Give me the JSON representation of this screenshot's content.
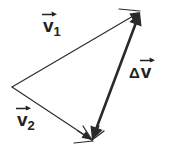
{
  "figure": {
    "type": "vector-diagram",
    "width": 169,
    "height": 152,
    "background_color": "#ffffff",
    "stroke_color": "#2a2a2a"
  },
  "labels": {
    "v1": {
      "base": "v",
      "subscript": "1",
      "has_overarrow": true,
      "text": "v⃗1"
    },
    "v2": {
      "base": "v",
      "subscript": "2",
      "has_overarrow": true,
      "text": "v⃗2"
    },
    "delta_v": {
      "delta": "Δ",
      "base": "v",
      "subscript": "",
      "has_overarrow": true,
      "text": "Δv⃗"
    }
  },
  "geometry": {
    "vertices": {
      "tail": {
        "x": 12,
        "y": 87
      },
      "head_top": {
        "x": 140,
        "y": 12
      },
      "head_bottom": {
        "x": 92,
        "y": 140
      }
    },
    "vectors": [
      {
        "name": "v1",
        "from": {
          "x": 12,
          "y": 87
        },
        "to": {
          "x": 140,
          "y": 12
        },
        "stroke_width": 1.1,
        "arrow_at_end": true,
        "arrow_at_start": false
      },
      {
        "name": "v2",
        "from": {
          "x": 12,
          "y": 87
        },
        "to": {
          "x": 92,
          "y": 140
        },
        "stroke_width": 1.1,
        "arrow_at_end": true,
        "arrow_at_start": false
      },
      {
        "name": "delta_v",
        "from": {
          "x": 92,
          "y": 140
        },
        "to": {
          "x": 140,
          "y": 12
        },
        "stroke_width": 2.6,
        "arrow_at_end": true,
        "arrow_at_start": true
      }
    ],
    "tick_marks": [
      {
        "name": "apex-tick",
        "x1": 119,
        "y1": 9,
        "x2": 140,
        "y2": 11
      },
      {
        "name": "base-tick",
        "x1": 74,
        "y1": 143,
        "x2": 93,
        "y2": 141
      }
    ]
  }
}
